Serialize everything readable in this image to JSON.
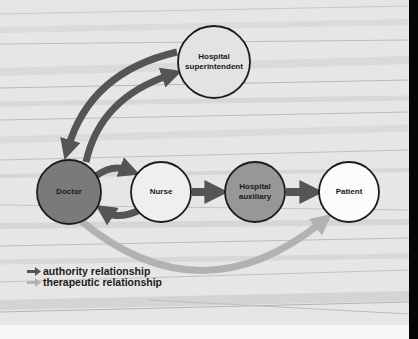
{
  "diagram": {
    "nodes": [
      {
        "id": "superintendent",
        "label": "Hospital\nsuperintendent",
        "fill": "#e3e3e3"
      },
      {
        "id": "doctor",
        "label": "Doctor",
        "fill": "#7a7a7a"
      },
      {
        "id": "nurse",
        "label": "Nurse",
        "fill": "#efefef"
      },
      {
        "id": "auxiliary",
        "label": "Hospital\nauxiliary",
        "fill": "#979797"
      },
      {
        "id": "patient",
        "label": "Patient",
        "fill": "#fbfbfb"
      }
    ],
    "edges": [
      {
        "from": "superintendent",
        "to": "doctor",
        "type": "authority"
      },
      {
        "from": "doctor",
        "to": "superintendent",
        "type": "authority"
      },
      {
        "from": "doctor",
        "to": "nurse",
        "type": "authority"
      },
      {
        "from": "nurse",
        "to": "doctor",
        "type": "authority"
      },
      {
        "from": "nurse",
        "to": "auxiliary",
        "type": "authority"
      },
      {
        "from": "auxiliary",
        "to": "patient",
        "type": "authority"
      },
      {
        "from": "doctor",
        "to": "patient",
        "type": "therapeutic"
      }
    ]
  },
  "legend": {
    "authority": {
      "label": "authority relationship",
      "color": "#555555"
    },
    "therapeutic": {
      "label": "therapeutic relationship",
      "color": "#b2b2b2"
    }
  }
}
